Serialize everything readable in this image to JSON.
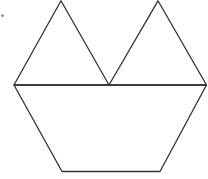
{
  "figure": {
    "stroke_color": "#333333",
    "marker_color": "#9a9a9a",
    "shapes": [
      {
        "name": "left-triangle",
        "kind": "triangle"
      },
      {
        "name": "right-triangle",
        "kind": "triangle"
      },
      {
        "name": "trapezoid",
        "kind": "trapezoid"
      }
    ],
    "labels": []
  }
}
